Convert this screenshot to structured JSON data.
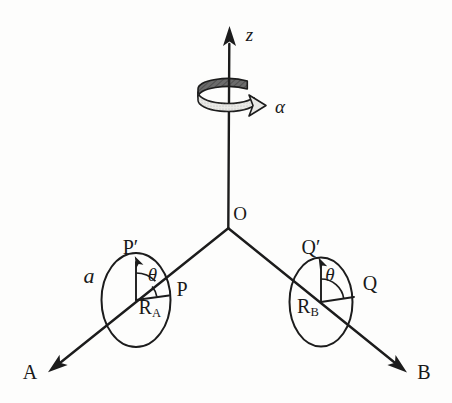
{
  "figure": {
    "kind": "rotating-shaft-with-two-discs-diagram",
    "background": "#fdfdfc",
    "ink": "#1c1c1c",
    "ribbon": {
      "back_fill": "#6b6b6b",
      "front_fill": "#e9e9e6"
    },
    "axis": {
      "z_label": "z",
      "alpha_label": "α",
      "origin_label": "O"
    },
    "arms": {
      "left_label": "A",
      "right_label": "B"
    },
    "left_disc": {
      "top_point": "P′",
      "rim_point": "P",
      "angle": "θ",
      "radius_symbol": "R",
      "radius_subscript": "A",
      "disc_radius_label": "a"
    },
    "right_disc": {
      "top_point": "Q′",
      "rim_point": "Q",
      "angle": "θ",
      "radius_symbol": "R",
      "radius_subscript": "B"
    }
  }
}
